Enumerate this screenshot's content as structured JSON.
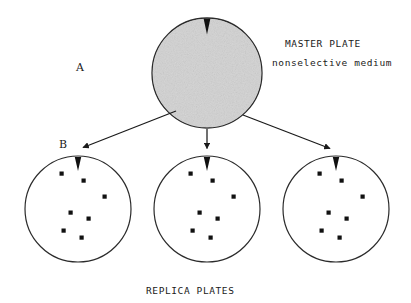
{
  "figure": {
    "title_labels": {
      "master_plate": "MASTER PLATE",
      "nonselective_medium": "nonselective medium",
      "replica_plates": "REPLICA PLATES",
      "panel_a": "A",
      "panel_b": "B"
    },
    "colors": {
      "ink": "#1a1a1a",
      "stroke": "#2b2b2b",
      "master_fill": "#c9c9c9",
      "master_fill_light": "#d8d8d8",
      "colony_dot": "#111111",
      "background": "#ffffff"
    },
    "master_plate": {
      "name": "master-plate",
      "cx": 207,
      "cy": 73,
      "r": 55,
      "notch": {
        "cx": 207,
        "top": 18,
        "width": 7,
        "depth": 16
      }
    },
    "replica_plates": [
      {
        "name": "replica-plate-left",
        "cx": 78,
        "cy": 209,
        "r": 53,
        "notch": {
          "cx": 78,
          "top": 156,
          "width": 7,
          "depth": 15
        },
        "colony_count": 7,
        "colonies": [
          {
            "x": 62,
            "y": 174
          },
          {
            "x": 84,
            "y": 181
          },
          {
            "x": 105,
            "y": 197
          },
          {
            "x": 71,
            "y": 213
          },
          {
            "x": 89,
            "y": 219
          },
          {
            "x": 64,
            "y": 231
          },
          {
            "x": 82,
            "y": 238
          }
        ]
      },
      {
        "name": "replica-plate-middle",
        "cx": 207,
        "cy": 209,
        "r": 53,
        "notch": {
          "cx": 207,
          "top": 156,
          "width": 7,
          "depth": 15
        },
        "colony_count": 7,
        "colonies": [
          {
            "x": 191,
            "y": 174
          },
          {
            "x": 213,
            "y": 181
          },
          {
            "x": 234,
            "y": 197
          },
          {
            "x": 200,
            "y": 213
          },
          {
            "x": 218,
            "y": 219
          },
          {
            "x": 193,
            "y": 231
          },
          {
            "x": 211,
            "y": 238
          }
        ]
      },
      {
        "name": "replica-plate-right",
        "cx": 336,
        "cy": 209,
        "r": 53,
        "notch": {
          "cx": 336,
          "top": 156,
          "width": 7,
          "depth": 15
        },
        "colony_count": 7,
        "colonies": [
          {
            "x": 320,
            "y": 174
          },
          {
            "x": 342,
            "y": 181
          },
          {
            "x": 363,
            "y": 197
          },
          {
            "x": 329,
            "y": 213
          },
          {
            "x": 347,
            "y": 219
          },
          {
            "x": 322,
            "y": 231
          },
          {
            "x": 340,
            "y": 238
          }
        ]
      }
    ],
    "arrows": [
      {
        "name": "arrow-to-left-plate",
        "x1": 176,
        "y1": 111,
        "x2": 80,
        "y2": 149
      },
      {
        "name": "arrow-to-middle-plate",
        "x1": 207,
        "y1": 129,
        "x2": 207,
        "y2": 151
      },
      {
        "name": "arrow-to-right-plate",
        "x1": 243,
        "y1": 115,
        "x2": 333,
        "y2": 150
      }
    ]
  }
}
